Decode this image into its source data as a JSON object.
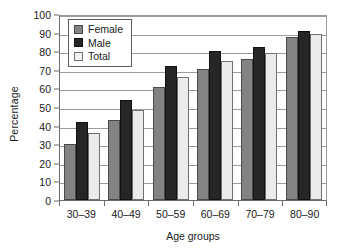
{
  "chart_data": {
    "type": "bar",
    "title": "",
    "xlabel": "Age groups",
    "ylabel": "Percentage",
    "categories": [
      "30–39",
      "40–49",
      "50–59",
      "60–69",
      "70–79",
      "80–90"
    ],
    "series": [
      {
        "name": "Female",
        "color": "#838383",
        "values": [
          30,
          43,
          61,
          70.5,
          76,
          87.5
        ]
      },
      {
        "name": "Male",
        "color": "#262626",
        "values": [
          42,
          54,
          72,
          80,
          82,
          91
        ]
      },
      {
        "name": "Total",
        "color": "#ebebeb",
        "values": [
          36,
          48.5,
          66,
          75,
          79,
          89.5
        ]
      }
    ],
    "ylim": [
      0,
      100
    ],
    "ytick_values": [
      0,
      10,
      20,
      30,
      40,
      50,
      60,
      70,
      80,
      90,
      100
    ],
    "ytick_labels": [
      "0",
      "10",
      "20",
      "30",
      "40",
      "50",
      "60",
      "70",
      "80",
      "90",
      "100"
    ],
    "grid": true,
    "legend_position": "top-left",
    "legend_entries": [
      "Female",
      "Male",
      "Total"
    ]
  }
}
